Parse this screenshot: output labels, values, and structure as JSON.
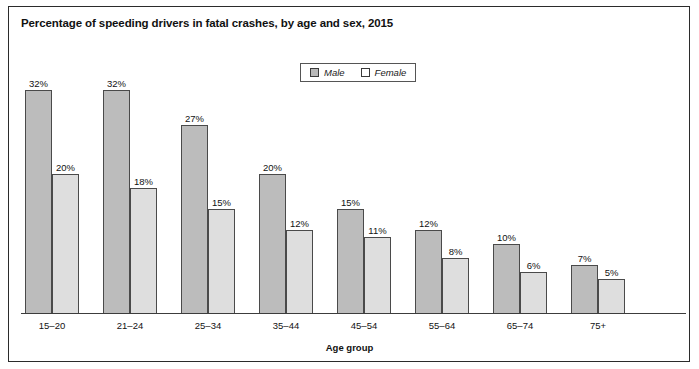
{
  "figure": {
    "title": "Percentage of speeding drivers in fatal crashes, by age and sex, 2015",
    "axis_title": "Age group",
    "frame_color": "#2b2b2b"
  },
  "legend": {
    "position": "top-center",
    "entries": [
      {
        "label": "Male",
        "swatch": "male-swatch",
        "color": "#b9b9b9"
      },
      {
        "label": "Female",
        "swatch": "female-swatch",
        "color": "#ffffff"
      }
    ]
  },
  "chart_data": {
    "type": "bar",
    "title": "Percentage of speeding drivers in fatal crashes, by age and sex, 2015",
    "xlabel": "Age group",
    "ylabel": "",
    "ylim": [
      0,
      32
    ],
    "grid": false,
    "legend_position": "top-center",
    "categories": [
      "15–20",
      "21–24",
      "25–34",
      "35–44",
      "45–54",
      "55–64",
      "65–74",
      "75+"
    ],
    "series": [
      {
        "name": "Male",
        "color": "#bcbcbc",
        "values": [
          32,
          32,
          27,
          20,
          15,
          12,
          10,
          7
        ],
        "labels": [
          "32%",
          "32%",
          "27%",
          "20%",
          "15%",
          "12%",
          "10%",
          "7%"
        ]
      },
      {
        "name": "Female",
        "color": "#dedede",
        "values": [
          20,
          18,
          15,
          12,
          11,
          8,
          6,
          5
        ],
        "labels": [
          "20%",
          "18%",
          "15%",
          "12%",
          "11%",
          "8%",
          "6%",
          "5%"
        ]
      }
    ]
  }
}
